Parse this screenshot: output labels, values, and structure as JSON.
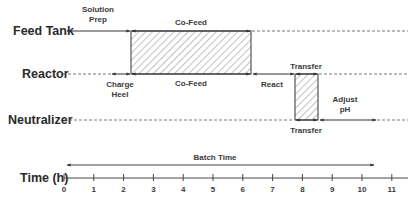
{
  "rows": [
    {
      "label": "Feed Tank"
    },
    {
      "label": "Reactor"
    },
    {
      "label": "Neutralizer"
    }
  ],
  "segments": {
    "solution_prep": {
      "line1": "Solution",
      "line2": "Prep",
      "row": "Feed Tank",
      "start_h": 0,
      "end_h": 2.2
    },
    "cofeed_top": {
      "label": "Co-Feed",
      "row": "Feed Tank",
      "start_h": 2.2,
      "end_h": 6.2
    },
    "charge_heel": {
      "line1": "Charge",
      "line2": "Heel",
      "row": "Reactor",
      "start_h": 1.8,
      "end_h": 2.2
    },
    "cofeed_bottom": {
      "label": "Co-Feed",
      "row": "Reactor",
      "start_h": 2.2,
      "end_h": 6.2
    },
    "react": {
      "label": "React",
      "row": "Reactor",
      "start_h": 6.2,
      "end_h": 7.7
    },
    "transfer_top": {
      "label": "Transfer",
      "row": "Reactor",
      "start_h": 7.7,
      "end_h": 8.4
    },
    "transfer_bottom": {
      "label": "Transfer",
      "row": "Neutralizer",
      "start_h": 7.7,
      "end_h": 8.4
    },
    "adjust_ph": {
      "line1": "Adjust",
      "line2": "pH",
      "row": "Neutralizer",
      "start_h": 8.5,
      "end_h": 10.4
    }
  },
  "batch_time": {
    "label": "Batch Time",
    "start_h": 0.1,
    "end_h": 10.4
  },
  "axis": {
    "label": "Time (h)",
    "ticks": [
      "0",
      "1",
      "2",
      "3",
      "4",
      "5",
      "6",
      "7",
      "8",
      "9",
      "10",
      "11"
    ]
  }
}
